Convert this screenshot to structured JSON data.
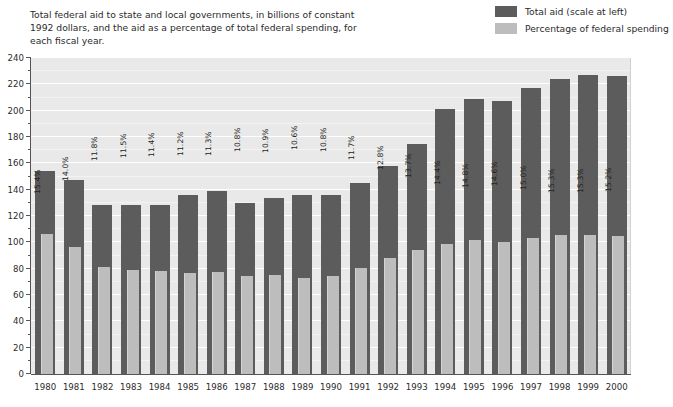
{
  "caption": "Total federal aid to state and local governments, in billions of constant 1992 dollars, and the aid as a percentage of total federal spending, for each fiscal year.",
  "legend": {
    "items": [
      {
        "label": "Total aid (scale at left)",
        "color": "#5c5c5c",
        "name": "total-aid"
      },
      {
        "label": "Percentage of federal spending",
        "color": "#bdbdbd",
        "name": "percentage-of-federal-spending"
      }
    ]
  },
  "colors": {
    "plot_background": "#e9e9e9",
    "gridline": "#ffffff",
    "bar_dark": "#5c5c5c",
    "bar_light": "#bdbdbd",
    "axis": "#555555",
    "text": "#2b2b2b"
  },
  "chart_data": {
    "type": "bar",
    "title": "Total federal aid to state and local governments, in billions of constant 1992 dollars, and the aid as a percentage of total federal spending, for each fiscal year.",
    "xlabel": "",
    "ylabel": "",
    "ylim": [
      0,
      240
    ],
    "ytick_step": 20,
    "yminor_step": 10,
    "grid": true,
    "legend_position": "top-right",
    "categories": [
      "1980",
      "1981",
      "1982",
      "1983",
      "1984",
      "1985",
      "1986",
      "1987",
      "1988",
      "1989",
      "1990",
      "1991",
      "1992",
      "1993",
      "1994",
      "1995",
      "1996",
      "1997",
      "1998",
      "1999",
      "2000"
    ],
    "ytick_labels": [
      "0",
      "20",
      "40",
      "60",
      "80",
      "100",
      "120",
      "140",
      "160",
      "180",
      "200",
      "220",
      "240"
    ],
    "series": [
      {
        "name": "Total aid (scale at left)",
        "color": "#5c5c5c",
        "units": "billions of constant 1992 dollars",
        "values": [
          154,
          147,
          128,
          128,
          128,
          136,
          139,
          130,
          134,
          136,
          136,
          145,
          158,
          175,
          201,
          209,
          207,
          217,
          224,
          227,
          226
        ]
      },
      {
        "name": "Percentage of federal spending",
        "color": "#bdbdbd",
        "units": "percent",
        "values": [
          15.4,
          14.0,
          11.8,
          11.5,
          11.4,
          11.2,
          11.3,
          10.8,
          10.9,
          10.6,
          10.8,
          11.7,
          12.8,
          13.7,
          14.4,
          14.8,
          14.6,
          15.0,
          15.3,
          15.3,
          15.2
        ],
        "data_labels": [
          "15.4%",
          "14.0%",
          "11.8%",
          "11.5%",
          "11.4%",
          "11.2%",
          "11.3%",
          "10.8%",
          "10.9%",
          "10.6%",
          "10.8%",
          "11.7%",
          "12.8%",
          "13.7%",
          "14.4%",
          "14.8%",
          "14.6%",
          "15.0%",
          "15.3%",
          "15.3%",
          "15.2%"
        ]
      }
    ]
  }
}
